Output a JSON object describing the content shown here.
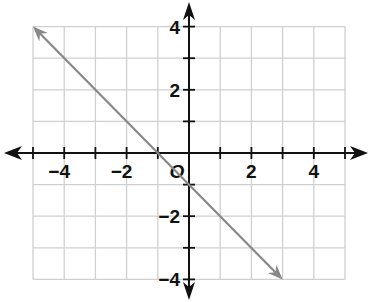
{
  "chart_data": {
    "type": "line",
    "title": "",
    "xlabel": "",
    "ylabel": "",
    "xlim": [
      -5,
      5
    ],
    "ylim": [
      -4,
      4
    ],
    "grid": true,
    "origin_label": "O",
    "x_tick_labels": [
      {
        "value": -4,
        "label": "−4"
      },
      {
        "value": -2,
        "label": "−2"
      },
      {
        "value": 2,
        "label": "2"
      },
      {
        "value": 4,
        "label": "4"
      }
    ],
    "y_tick_labels": [
      {
        "value": 4,
        "label": "4"
      },
      {
        "value": 2,
        "label": "2"
      },
      {
        "value": -2,
        "label": "−2"
      },
      {
        "value": -4,
        "label": "−4"
      }
    ],
    "series": [
      {
        "name": "line",
        "equation": "y = -x - 1",
        "x": [
          -5,
          3
        ],
        "y": [
          4,
          -4
        ],
        "arrows": "both",
        "color": "#888888"
      }
    ]
  },
  "colors": {
    "grid": "#d0d0d0",
    "axis": "#111111",
    "line": "#888888"
  }
}
